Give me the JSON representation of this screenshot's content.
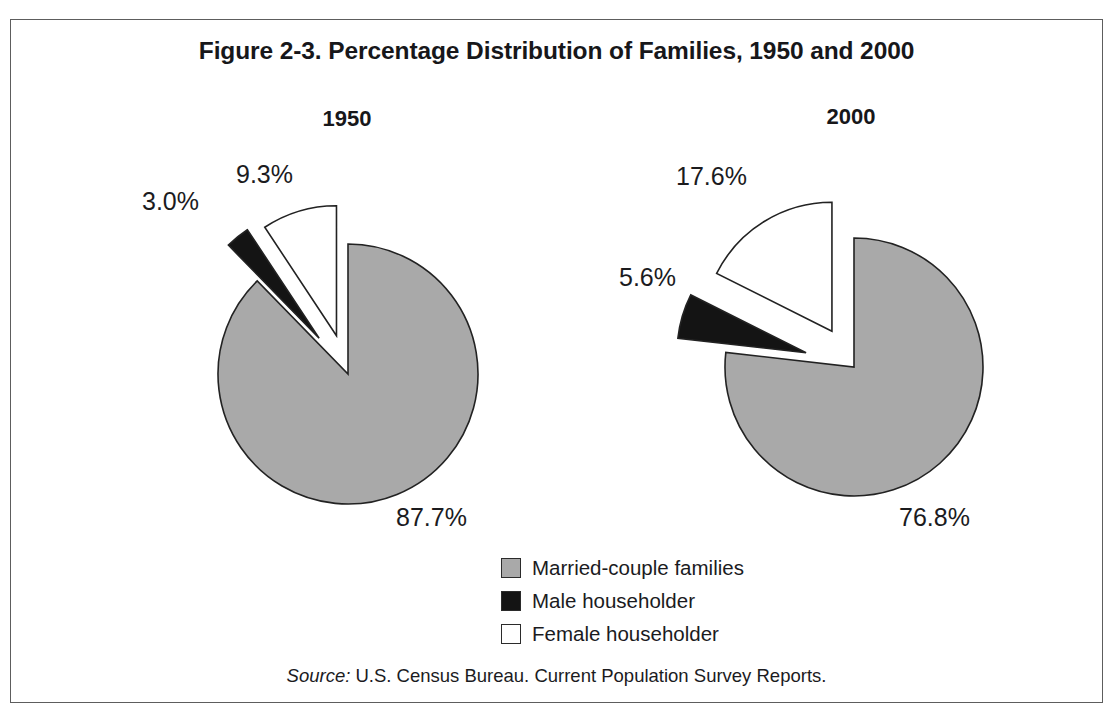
{
  "figure": {
    "title": "Figure 2-3. Percentage Distribution of Families, 1950 and 2000",
    "source_prefix": "Source:",
    "source_text": "U.S. Census Bureau. Current Population Survey Reports.",
    "frame_border_color": "#5d5d5d",
    "background": "#ffffff"
  },
  "legend": {
    "items": [
      {
        "label": "Married-couple families",
        "color": "#a9a9a9",
        "swatch": "gray-swatch"
      },
      {
        "label": "Male householder",
        "color": "#141414",
        "swatch": "black-swatch"
      },
      {
        "label": "Female householder",
        "color": "#ffffff",
        "swatch": "white-swatch"
      }
    ]
  },
  "panels": [
    {
      "heading": "1950",
      "labels": {
        "married": "87.7%",
        "male": "3.0%",
        "female": "9.3%"
      }
    },
    {
      "heading": "2000",
      "labels": {
        "married": "76.8%",
        "male": "5.6%",
        "female": "17.6%"
      }
    }
  ],
  "chart_data": {
    "type": "pie",
    "title": "Figure 2-3. Percentage Distribution of Families, 1950 and 2000",
    "subtitle": "",
    "xlabel": "",
    "ylabel": "",
    "legend_position": "bottom-center",
    "grid": false,
    "categories": [
      "Married-couple families",
      "Male householder",
      "Female householder"
    ],
    "colors": [
      "#a9a9a9",
      "#141414",
      "#ffffff"
    ],
    "charts": [
      {
        "name": "1950",
        "labels": [
          "Married-couple families",
          "Male householder",
          "Female householder"
        ],
        "values": [
          87.7,
          3.0,
          9.3
        ],
        "value_labels": [
          "87.7%",
          "3.0%",
          "9.3%"
        ],
        "units": "percent",
        "start_angle_deg": 0,
        "direction": "clockwise",
        "exploded": [
          false,
          true,
          true
        ],
        "geometry": {
          "cx": 337,
          "cy": 354,
          "r": 130,
          "explode_male": 46,
          "explode_female": 40
        }
      },
      {
        "name": "2000",
        "labels": [
          "Married-couple families",
          "Male householder",
          "Female householder"
        ],
        "values": [
          76.8,
          5.6,
          17.6
        ],
        "value_labels": [
          "76.8%",
          "5.6%",
          "17.6%"
        ],
        "units": "percent",
        "start_angle_deg": 0,
        "direction": "clockwise",
        "exploded": [
          false,
          true,
          true
        ],
        "geometry": {
          "cx": 843,
          "cy": 347,
          "r": 129,
          "explode_male": 50,
          "explode_female": 42
        }
      }
    ]
  }
}
